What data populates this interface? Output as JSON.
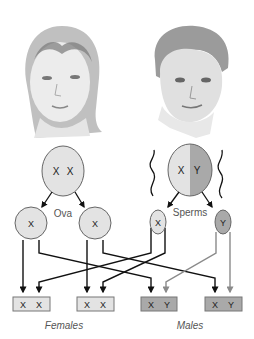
{
  "portraits": [
    {
      "name": "female-portrait",
      "description": "pencil sketch of a woman"
    },
    {
      "name": "male-portrait",
      "description": "pencil sketch of a man"
    }
  ],
  "parents": {
    "female": {
      "chromosomes": [
        "X",
        "X"
      ]
    },
    "male": {
      "chromosomes": [
        "X",
        "Y"
      ]
    }
  },
  "gametes": {
    "ova_label": "Ova",
    "sperms_label": "Sperms",
    "ova": [
      "X",
      "X"
    ],
    "sperms": [
      "X",
      "Y"
    ]
  },
  "offspring": [
    {
      "chromosomes": [
        "X",
        "X"
      ],
      "sex": "female"
    },
    {
      "chromosomes": [
        "X",
        "X"
      ],
      "sex": "female"
    },
    {
      "chromosomes": [
        "X",
        "Y"
      ],
      "sex": "male"
    },
    {
      "chromosomes": [
        "X",
        "Y"
      ],
      "sex": "male"
    }
  ],
  "labels": {
    "females": "Females",
    "males": "Males"
  },
  "colors": {
    "light_fill": "#e3e3e3",
    "dark_fill": "#a9a9a9",
    "line": "#111111",
    "y_line": "#8a8a8a",
    "label_text": "#555555"
  }
}
